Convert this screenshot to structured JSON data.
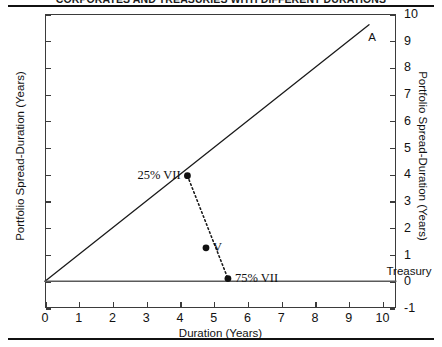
{
  "chart_data": {
    "type": "scatter",
    "title": "CORPORATES AND TREASURIES WITH DIFFERENT DURATIONS",
    "xlabel": "Duration (Years)",
    "ylabel": "Portfolio Spread-Duration (Years)",
    "ylabel_right": "Portfolio Spread-Duration (Years)",
    "xlim": [
      0,
      10.4
    ],
    "ylim": [
      -1,
      10
    ],
    "xticks": [
      0,
      1,
      2,
      3,
      4,
      5,
      6,
      7,
      8,
      9,
      10
    ],
    "xticklabels": [
      "0",
      "1",
      "2",
      "3",
      "4",
      "5",
      "6",
      "7",
      "8",
      "9",
      "10"
    ],
    "yticks": [
      -1,
      0,
      1,
      2,
      3,
      4,
      5,
      6,
      7,
      8,
      9,
      10
    ],
    "yticklabels": [
      "-1",
      "0",
      "1",
      "2",
      "3",
      "4",
      "5",
      "6",
      "7",
      "8",
      "9",
      "10"
    ],
    "grid": false,
    "legend": false,
    "series": [
      {
        "name": "corporate-line",
        "type": "line",
        "style": "solid",
        "color": "#1a1a1a",
        "points": [
          [
            0,
            0
          ],
          [
            9.6,
            9.6
          ]
        ]
      },
      {
        "name": "treasury-line",
        "type": "line",
        "style": "solid",
        "color": "#5a5a5a",
        "points": [
          [
            0,
            0
          ],
          [
            10.4,
            0
          ]
        ]
      },
      {
        "name": "blend-line",
        "type": "line",
        "style": "dotted",
        "color": "#1a1a1a",
        "points": [
          [
            4.22,
            3.95
          ],
          [
            5.42,
            0.1
          ]
        ]
      }
    ],
    "points": [
      {
        "label": "25% VII",
        "x": 4.22,
        "y": 3.95,
        "label_pos": "left"
      },
      {
        "label": "V",
        "x": 4.77,
        "y": 1.25,
        "label_pos": "right"
      },
      {
        "label": "75% VII",
        "x": 5.42,
        "y": 0.1,
        "label_pos": "right"
      }
    ],
    "annotations": [
      {
        "label": "A",
        "x": 9.46,
        "y": 9.1,
        "style": "sans"
      },
      {
        "label": "Treasury",
        "x": 10.0,
        "y": 0.32,
        "style": "sans"
      }
    ]
  }
}
